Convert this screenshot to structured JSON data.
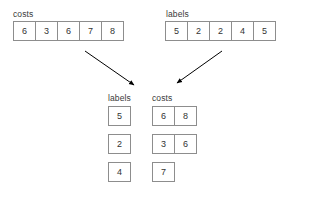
{
  "background_color": "#ffffff",
  "border_color": "#8d8d8d",
  "text_color": "#333333",
  "label_color": "#3a3a3a",
  "arrow_color": "#000000",
  "inputs": {
    "costs": {
      "label": "costs",
      "values": [
        "6",
        "3",
        "6",
        "7",
        "8"
      ]
    },
    "labels": {
      "label": "labels",
      "values": [
        "5",
        "2",
        "2",
        "4",
        "5"
      ]
    }
  },
  "outputs": {
    "labels": {
      "label": "labels",
      "values": [
        "5",
        "2",
        "4"
      ]
    },
    "costs": {
      "label": "costs",
      "rows": [
        [
          "6",
          "8"
        ],
        [
          "3",
          "6"
        ],
        [
          "7"
        ]
      ]
    }
  },
  "arrows": [
    {
      "name": "costs-to-grouped",
      "from_x": 85,
      "from_y": 51,
      "to_x": 134,
      "to_y": 85
    },
    {
      "name": "labels-to-grouped",
      "from_x": 222,
      "from_y": 51,
      "to_x": 177,
      "to_y": 83
    }
  ]
}
